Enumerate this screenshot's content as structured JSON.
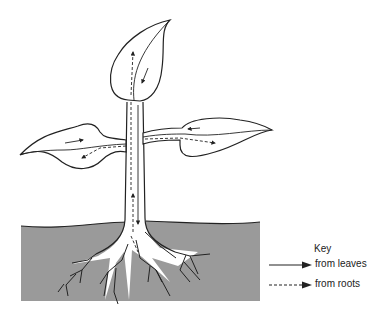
{
  "diagram": {
    "colors": {
      "soil": "#9a9a9a",
      "line": "#222222",
      "background": "#ffffff"
    },
    "parts": [
      "top leaf",
      "left leaf",
      "right leaf",
      "stem",
      "soil",
      "roots"
    ]
  },
  "key": {
    "title": "Key",
    "items": [
      {
        "label": "from leaves",
        "line_style": "solid"
      },
      {
        "label": "from roots",
        "line_style": "dashed"
      }
    ]
  }
}
